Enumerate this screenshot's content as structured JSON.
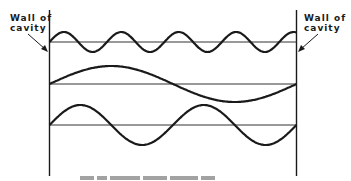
{
  "figure": {
    "labels": {
      "left": [
        "Wall of",
        "cavity"
      ],
      "right": [
        "Wall of",
        "cavity"
      ]
    },
    "caption_visible": "partially cut off at bottom edge, unreadable",
    "colors": {
      "ink": "#1a1a1a",
      "background": "#ffffff",
      "baseline": "#333333"
    },
    "cavity": {
      "left_wall_x": 49,
      "right_wall_x": 296,
      "top_y": 10,
      "bottom_y": 176
    },
    "modes": [
      {
        "name": "high-frequency mode",
        "baseline_y": 42,
        "amplitude": 10,
        "cycles": 4.3
      },
      {
        "name": "fundamental mode",
        "baseline_y": 84,
        "amplitude": 18,
        "cycles": 1
      },
      {
        "name": "second mode",
        "baseline_y": 125,
        "amplitude": 20,
        "cycles": 2
      }
    ]
  }
}
